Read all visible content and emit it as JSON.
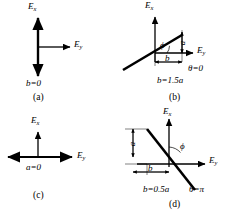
{
  "figure": {
    "stroke_color": "#000000",
    "background_color": "#ffffff",
    "panels": [
      {
        "id": "a",
        "caption": "(a)",
        "axis_vertical_label": "E",
        "axis_vertical_sub": "x",
        "axis_horizontal_label": "E",
        "axis_horizontal_sub": "y",
        "condition": "b=0",
        "theta": "",
        "phi": "",
        "dim_a": "",
        "dim_b": "",
        "description": "vertical double-headed line through origin"
      },
      {
        "id": "b",
        "caption": "(b)",
        "axis_vertical_label": "E",
        "axis_vertical_sub": "x",
        "axis_horizontal_label": "E",
        "axis_horizontal_sub": "y",
        "condition": "b=1.5a",
        "theta": "θ=0",
        "phi": "ϕ",
        "dim_a": "a",
        "dim_b": "b",
        "description": "line tilted up to the right with positive slope"
      },
      {
        "id": "c",
        "caption": "(c)",
        "axis_vertical_label": "E",
        "axis_vertical_sub": "x",
        "axis_horizontal_label": "E",
        "axis_horizontal_sub": "y",
        "condition": "a=0",
        "theta": "",
        "phi": "",
        "dim_a": "",
        "dim_b": "",
        "description": "horizontal double-headed line through origin"
      },
      {
        "id": "d",
        "caption": "(d)",
        "axis_vertical_label": "E",
        "axis_vertical_sub": "x",
        "axis_horizontal_label": "E",
        "axis_horizontal_sub": "y",
        "condition": "b=0.5a",
        "theta": "θ=π",
        "phi": "ϕ",
        "dim_a": "a",
        "dim_b": "b",
        "description": "line tilted down to the right with negative slope"
      }
    ]
  }
}
